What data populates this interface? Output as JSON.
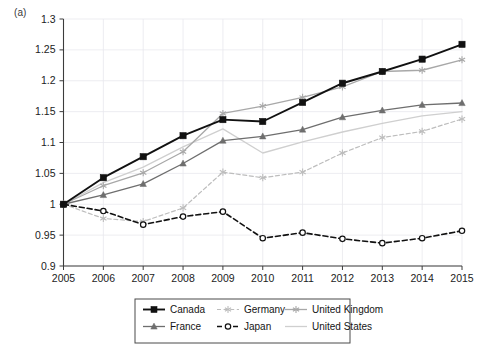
{
  "figure": {
    "panel_label": "(a)"
  },
  "chart_data": {
    "type": "line",
    "title": "",
    "xlabel": "",
    "ylabel": "",
    "categories": [
      2005,
      2006,
      2007,
      2008,
      2009,
      2010,
      2011,
      2012,
      2013,
      2014,
      2015
    ],
    "x_tick_labels": [
      "2005",
      "2006",
      "2007",
      "2008",
      "2009",
      "2010",
      "2011",
      "2012",
      "2013",
      "2014",
      "2015"
    ],
    "y_tick_labels": [
      "0.9",
      "0.95",
      "1",
      "1.05",
      "1.1",
      "1.15",
      "1.2",
      "1.25",
      "1.3"
    ],
    "y_ticks": [
      0.9,
      0.95,
      1.0,
      1.05,
      1.1,
      1.15,
      1.2,
      1.25,
      1.3
    ],
    "ylim": [
      0.9,
      1.3
    ],
    "xlim": [
      2005,
      2015
    ],
    "grid": true,
    "legend_position": "bottom",
    "series": [
      {
        "name": "Canada",
        "color": "#111111",
        "dash": "none",
        "marker": "square-filled",
        "width": 1.9,
        "values": [
          1.0,
          1.043,
          1.077,
          1.111,
          1.137,
          1.134,
          1.165,
          1.196,
          1.215,
          1.235,
          1.259
        ]
      },
      {
        "name": "France",
        "color": "#6e6e6e",
        "dash": "none",
        "marker": "triangle",
        "width": 1.3,
        "values": [
          1.0,
          1.015,
          1.033,
          1.066,
          1.103,
          1.11,
          1.121,
          1.141,
          1.152,
          1.161,
          1.164
        ]
      },
      {
        "name": "Germany",
        "color": "#bdbdbd",
        "dash": "dashed",
        "marker": "star",
        "width": 1.2,
        "values": [
          1.0,
          0.977,
          0.972,
          0.994,
          1.052,
          1.043,
          1.052,
          1.083,
          1.108,
          1.118,
          1.138
        ]
      },
      {
        "name": "Japan",
        "color": "#111111",
        "dash": "dashed",
        "marker": "circle-open",
        "width": 1.6,
        "values": [
          1.0,
          0.989,
          0.967,
          0.98,
          0.988,
          0.945,
          0.954,
          0.944,
          0.937,
          0.945,
          0.957
        ]
      },
      {
        "name": "United Kingdom",
        "color": "#a8a8a8",
        "dash": "none",
        "marker": "star",
        "width": 1.3,
        "values": [
          1.0,
          1.03,
          1.051,
          1.085,
          1.147,
          1.159,
          1.173,
          1.19,
          1.215,
          1.217,
          1.234
        ]
      },
      {
        "name": "United States",
        "color": "#cfcfcf",
        "dash": "none",
        "marker": "none",
        "width": 1.3,
        "values": [
          1.0,
          1.035,
          1.06,
          1.093,
          1.122,
          1.083,
          1.101,
          1.117,
          1.131,
          1.143,
          1.15
        ]
      }
    ],
    "legend_entries": [
      {
        "label": "Canada",
        "series": "Canada"
      },
      {
        "label": "Germany",
        "series": "Germany"
      },
      {
        "label": "United Kingdom",
        "series": "United Kingdom"
      },
      {
        "label": "France",
        "series": "France"
      },
      {
        "label": "Japan",
        "series": "Japan"
      },
      {
        "label": "United States",
        "series": "United States"
      }
    ]
  }
}
